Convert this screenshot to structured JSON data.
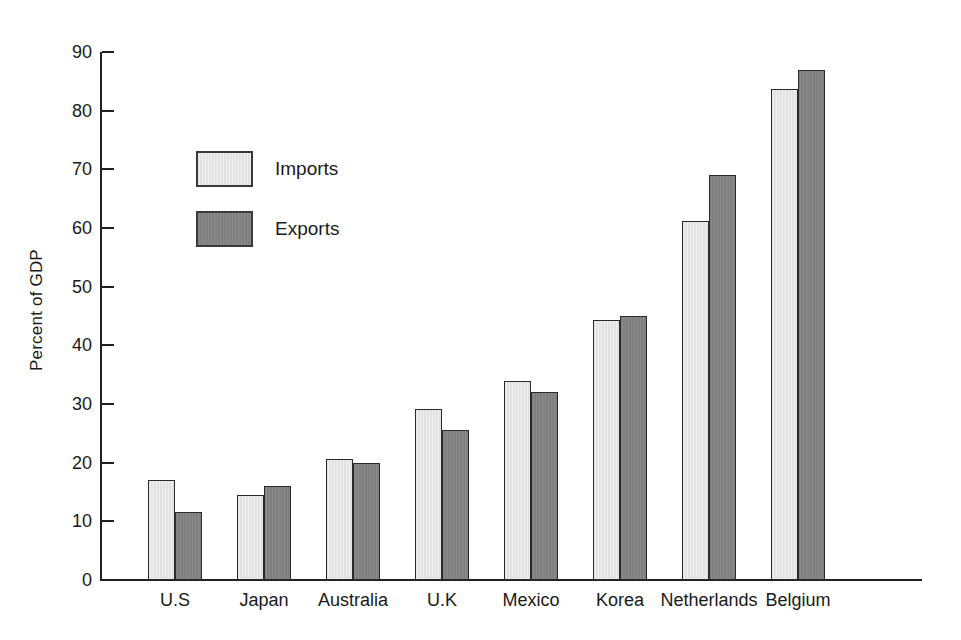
{
  "chart_data": {
    "type": "bar",
    "title": "",
    "subtitle": "",
    "xlabel": "",
    "ylabel": "Percent of GDP",
    "ylim": [
      0,
      90
    ],
    "ytick_step": 10,
    "yticks": [
      0,
      10,
      20,
      30,
      40,
      50,
      60,
      70,
      80,
      90
    ],
    "grid": false,
    "legend_position": "upper-left-inside",
    "categories": [
      "U.S",
      "Japan",
      "Australia",
      "U.K",
      "Mexico",
      "Korea",
      "Netherlands",
      "Belgium"
    ],
    "series": [
      {
        "name": "Imports",
        "color": "#e8e8e8",
        "values": [
          17.0,
          14.5,
          20.6,
          29.1,
          34.0,
          44.3,
          61.2,
          83.7
        ]
      },
      {
        "name": "Exports",
        "color": "#848484",
        "values": [
          11.6,
          16.0,
          19.9,
          25.5,
          32.0,
          45.0,
          69.1,
          86.9
        ]
      }
    ]
  },
  "legend": {
    "items": [
      {
        "label": "Imports",
        "swatch": "imports"
      },
      {
        "label": "Exports",
        "swatch": "exports"
      }
    ]
  },
  "axes": {
    "y_title": "Percent of GDP"
  }
}
